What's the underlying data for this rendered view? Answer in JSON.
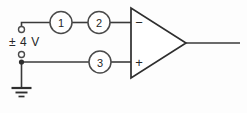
{
  "diagram": {
    "background_color": "#fdfdfd",
    "line_color": "#3a3a3a",
    "source": {
      "label": "± 4 V",
      "top_terminal_name": "open-terminal-positive",
      "bottom_terminal_name": "open-terminal-negative"
    },
    "nodes": [
      {
        "id": "1",
        "label": "1",
        "wire": "inverting-input-branch"
      },
      {
        "id": "2",
        "label": "2",
        "wire": "inverting-input-branch"
      },
      {
        "id": "3",
        "label": "3",
        "wire": "noninverting-input-branch"
      }
    ],
    "opamp": {
      "name": "operational-amplifier",
      "inverting_sign": "−",
      "noninverting_sign": "+",
      "output_wire_name": "output-wire"
    },
    "ground": {
      "name": "ground-symbol",
      "bar_count": 3
    }
  }
}
